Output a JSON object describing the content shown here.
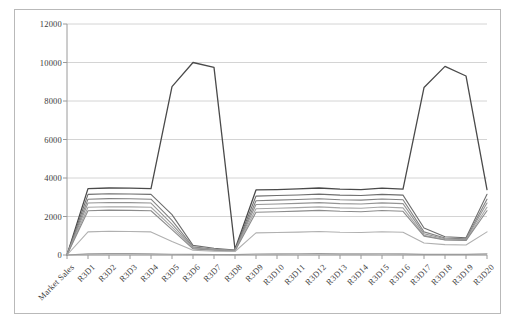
{
  "chart_data": {
    "type": "line",
    "title": "",
    "xlabel": "",
    "ylabel": "",
    "ylim": [
      0,
      12000
    ],
    "ytick_step": 2000,
    "yticks": [
      0,
      2000,
      4000,
      6000,
      8000,
      10000,
      12000
    ],
    "ytick_labels": [
      "0",
      "2000",
      "4000",
      "6000",
      "8000",
      "10000",
      "12000"
    ],
    "grid": true,
    "grid_axis": "y",
    "legend": "none",
    "categories": [
      "Market Sales",
      "R3D1",
      "R3D2",
      "R3D3",
      "R3D4",
      "R3D5",
      "R3D6",
      "R3D7",
      "R3D8",
      "R3D9",
      "R3D10",
      "R3D11",
      "R3D12",
      "R3D13",
      "R3D14",
      "R3D15",
      "R3D16",
      "R3D17",
      "R3D18",
      "R3D19",
      "R3D20"
    ],
    "series": [
      {
        "name": "Series 1",
        "color": "#4a4a4a",
        "values": [
          0,
          3450,
          3480,
          3470,
          3450,
          8750,
          10000,
          9750,
          300,
          3380,
          3400,
          3430,
          3480,
          3420,
          3400,
          3470,
          3420,
          8700,
          9800,
          9300,
          3400
        ]
      },
      {
        "name": "Series 2",
        "color": "#6d6d6d",
        "values": [
          0,
          3150,
          3180,
          3170,
          3150,
          2100,
          500,
          350,
          260,
          3060,
          3090,
          3120,
          3160,
          3110,
          3090,
          3150,
          3110,
          1400,
          950,
          900,
          3150
        ]
      },
      {
        "name": "Series 3",
        "color": "#828282",
        "values": [
          0,
          2900,
          2930,
          2920,
          2900,
          1800,
          420,
          300,
          240,
          2820,
          2850,
          2880,
          2920,
          2870,
          2850,
          2910,
          2870,
          1200,
          880,
          840,
          2900
        ]
      },
      {
        "name": "Series 4",
        "color": "#949494",
        "values": [
          0,
          2700,
          2730,
          2720,
          2700,
          1600,
          380,
          280,
          230,
          2620,
          2650,
          2680,
          2720,
          2670,
          2650,
          2710,
          2670,
          1100,
          840,
          800,
          2700
        ]
      },
      {
        "name": "Series 5",
        "color": "#a6a6a6",
        "values": [
          0,
          2480,
          2510,
          2500,
          2480,
          1450,
          340,
          260,
          220,
          2400,
          2430,
          2460,
          2500,
          2450,
          2430,
          2490,
          2450,
          1020,
          800,
          770,
          2480
        ]
      },
      {
        "name": "Series 6",
        "color": "#8c8c8c",
        "values": [
          0,
          2300,
          2330,
          2320,
          2300,
          1320,
          320,
          250,
          210,
          2220,
          2250,
          2280,
          2320,
          2270,
          2250,
          2310,
          2270,
          980,
          780,
          750,
          2300
        ]
      },
      {
        "name": "Series 7",
        "color": "#b0b0b0",
        "values": [
          0,
          1200,
          1230,
          1220,
          1200,
          700,
          250,
          200,
          180,
          1150,
          1170,
          1190,
          1220,
          1180,
          1170,
          1210,
          1180,
          620,
          540,
          520,
          1200
        ]
      },
      {
        "name": "Series 8",
        "color": "#9c9c9c",
        "values": [
          0,
          60,
          70,
          70,
          60,
          40,
          30,
          25,
          20,
          55,
          60,
          65,
          70,
          60,
          60,
          65,
          60,
          35,
          30,
          30,
          60
        ]
      }
    ]
  },
  "frame": {
    "border_color": "#b9b9b9",
    "plot_background": "#ffffff",
    "gridline_color": "#d4d4d4",
    "axis_color": "#9a9a9a"
  }
}
